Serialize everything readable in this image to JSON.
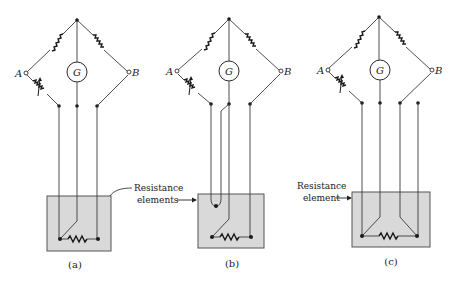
{
  "figure": {
    "diagrams": [
      {
        "id": "a",
        "caption": "(a)",
        "terminal_left": "A",
        "terminal_right": "B",
        "galvanometer": "G",
        "lead_wires": 3
      },
      {
        "id": "b",
        "caption": "(b)",
        "terminal_left": "A",
        "terminal_right": "B",
        "galvanometer": "G",
        "lead_wires": 4
      },
      {
        "id": "c",
        "caption": "(c)",
        "terminal_left": "A",
        "terminal_right": "B",
        "galvanometer": "G",
        "lead_wires": 4
      }
    ],
    "callouts": {
      "ab_line1": "Resistance",
      "ab_line2": "elements",
      "c_line1": "Resistance",
      "c_line2": "element"
    },
    "colors": {
      "element_box": "#d9d9d9",
      "lines": "#3a3a3a"
    }
  }
}
